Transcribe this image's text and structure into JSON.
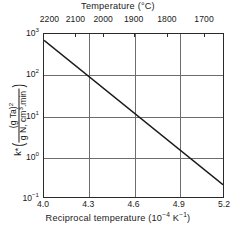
{
  "chart_data": {
    "type": "line",
    "title": "",
    "xlabel": "Reciprocal temperature (10⁻⁴ K⁻¹)",
    "ylabel": "k* ((g Ta)² / (g N, cm³·min))",
    "y_scale": "log",
    "xlim": [
      4.0,
      5.2
    ],
    "ylim": [
      0.1,
      1000
    ],
    "grid": true,
    "legend": null,
    "series": [
      {
        "name": "k*",
        "x": [
          4.0,
          5.2
        ],
        "y": [
          700,
          0.2
        ]
      }
    ],
    "x_ticks": [
      {
        "value": 4.0,
        "label": "4.0"
      },
      {
        "value": 4.3,
        "label": "4.3"
      },
      {
        "value": 4.6,
        "label": "4.6"
      },
      {
        "value": 4.9,
        "label": "4.9"
      },
      {
        "value": 5.2,
        "label": "5.2"
      }
    ],
    "y_ticks": [
      {
        "value": 1000,
        "mantissa": "10",
        "exponent": "3"
      },
      {
        "value": 100,
        "mantissa": "10",
        "exponent": "2"
      },
      {
        "value": 10,
        "mantissa": "10",
        "exponent": "1"
      },
      {
        "value": 1,
        "mantissa": "10",
        "exponent": "0"
      },
      {
        "value": 0.1,
        "mantissa": "10",
        "exponent": "-1"
      }
    ],
    "secondary_axis": {
      "position": "top",
      "title": "Temperature (°C)",
      "units": "°C",
      "ticks": [
        {
          "label": "2200",
          "reciprocal": 4.043
        },
        {
          "label": "2100",
          "reciprocal": 4.215
        },
        {
          "label": "2000",
          "reciprocal": 4.399
        },
        {
          "label": "1900",
          "reciprocal": 4.601
        },
        {
          "label": "1800",
          "reciprocal": 4.822
        },
        {
          "label": "1700",
          "reciprocal": 5.068
        }
      ]
    },
    "gridlines": {
      "vertical": [
        4.3,
        4.6,
        4.9
      ],
      "horizontal": [
        1000,
        100,
        10,
        1,
        0.1
      ]
    }
  },
  "axes": {
    "top_title": "Temperature (°C)",
    "bottom_title_text": "Reciprocal temperature (10",
    "bottom_title_exp1": "−4",
    "bottom_title_mid": " K",
    "bottom_title_exp2": "−1",
    "bottom_title_end": ")",
    "y_label_symbol": "k*",
    "y_label_numerator": "(g Ta)",
    "y_label_numerator_exp": "2",
    "y_label_denominator_a": "g N, cm",
    "y_label_denominator_exp": "3",
    "y_label_denominator_b": ".min"
  },
  "colors": {
    "line": "#1a1a1a",
    "grid": "#6d6d6d",
    "frame": "#2a2a2a",
    "background": "#ffffff"
  }
}
